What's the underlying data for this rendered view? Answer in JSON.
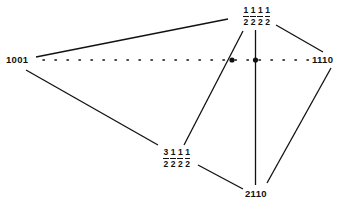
{
  "diagram": {
    "nodes": {
      "left": {
        "label": "1001"
      },
      "right": {
        "label": "1110"
      },
      "bottom": {
        "label": "2110"
      },
      "top": {
        "fractions": [
          {
            "num": "1",
            "den": "2"
          },
          {
            "num": "1",
            "den": "2"
          },
          {
            "num": "1",
            "den": "2"
          },
          {
            "num": "1",
            "den": "2"
          }
        ]
      },
      "middle_bottom": {
        "fractions": [
          {
            "num": "3",
            "den": "2"
          },
          {
            "num": "1",
            "den": "2"
          },
          {
            "num": "1",
            "den": "2"
          },
          {
            "num": "1",
            "den": "2"
          }
        ]
      }
    },
    "edges": [
      {
        "from": "left",
        "to": "top",
        "style": "solid"
      },
      {
        "from": "top",
        "to": "right",
        "style": "solid"
      },
      {
        "from": "left",
        "to": "right",
        "style": "dotted"
      },
      {
        "from": "left",
        "to": "middle_bottom",
        "style": "solid"
      },
      {
        "from": "middle_bottom",
        "to": "top",
        "style": "solid",
        "via_point": "intersection-1"
      },
      {
        "from": "top",
        "to": "bottom",
        "style": "solid",
        "via_point": "intersection-2"
      },
      {
        "from": "middle_bottom",
        "to": "bottom",
        "style": "solid"
      },
      {
        "from": "right",
        "to": "bottom",
        "style": "solid"
      }
    ],
    "intersection_points": [
      {
        "name": "intersection-1"
      },
      {
        "name": "intersection-2"
      }
    ],
    "colors": {
      "line": "#111111",
      "background": "#ffffff"
    }
  }
}
